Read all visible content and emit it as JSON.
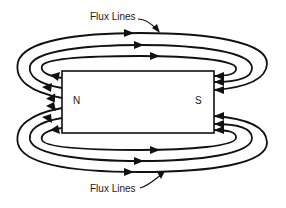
{
  "diagram": {
    "magnet": {
      "north_label": "N",
      "south_label": "S"
    },
    "annotations": {
      "top_label": "Flux Lines",
      "bottom_label": "Flux Lines"
    },
    "flux_direction": "from N pole (left) around to S pole (right)",
    "flux_line_count": 6,
    "colors": {
      "stroke": "#111111",
      "background": "#ffffff"
    }
  }
}
